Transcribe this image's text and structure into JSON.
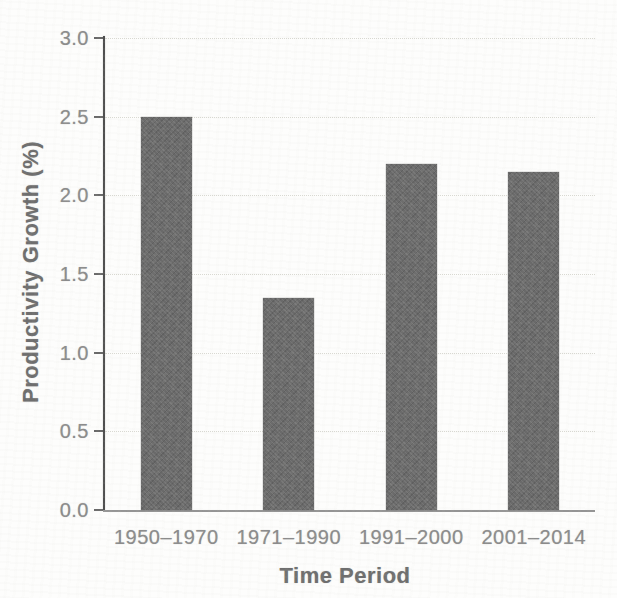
{
  "chart_data": {
    "type": "bar",
    "title": "",
    "xlabel": "Time Period",
    "ylabel": "Productivity Growth (%)",
    "categories": [
      "1950–1970",
      "1971–1990",
      "1991–2000",
      "2001–2014"
    ],
    "values": [
      2.5,
      1.35,
      2.2,
      2.15
    ],
    "ylim": [
      0.0,
      3.0
    ],
    "ytick_step": 0.5,
    "ytick_labels": [
      "0.0",
      "0.5",
      "1.0",
      "1.5",
      "2.0",
      "2.5",
      "3.0"
    ],
    "grid": "horizontal-dotted",
    "legend": "none",
    "colors": {
      "bar": "#6a6a6a",
      "axis": "#4f4f4f",
      "baseline": "#949494",
      "gridline": "#d9d9d2",
      "tick_text": "#8b8b8b",
      "axis_title_text": "#6e6e6e",
      "background": "#fdfdfc"
    }
  }
}
